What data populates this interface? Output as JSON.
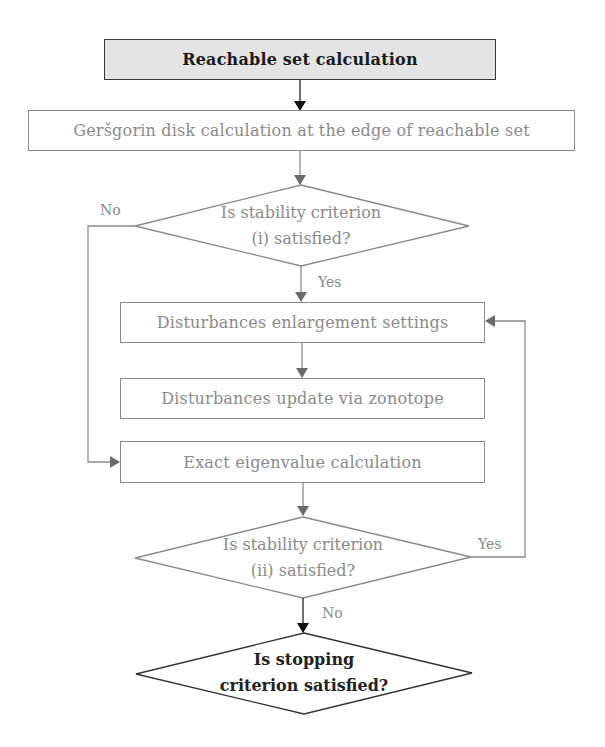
{
  "diagram": {
    "type": "flowchart",
    "nodes": {
      "start": {
        "label": "Reachable set calculation",
        "shape": "rectangle",
        "fill": "#e4e4e4"
      },
      "gersgorin": {
        "label": "Geršgorin disk calculation at the edge of reachable set",
        "shape": "rectangle"
      },
      "decision1": {
        "line1": "Is stability criterion",
        "line2": "(i) satisfied?",
        "shape": "diamond"
      },
      "enlarge": {
        "label": "Disturbances enlargement settings",
        "shape": "rectangle"
      },
      "update": {
        "label": "Disturbances update via zonotope",
        "shape": "rectangle"
      },
      "eigen": {
        "label": "Exact eigenvalue calculation",
        "shape": "rectangle"
      },
      "decision2": {
        "line1": "Is stability criterion",
        "line2": "(ii) satisfied?",
        "shape": "diamond"
      },
      "decision3": {
        "line1": "Is stopping",
        "line2": "criterion satisfied?",
        "shape": "diamond"
      }
    },
    "edge_labels": {
      "d1_no": "No",
      "d1_yes": "Yes",
      "d2_yes": "Yes",
      "d2_no": "No"
    },
    "edges": [
      {
        "from": "start",
        "to": "gersgorin"
      },
      {
        "from": "gersgorin",
        "to": "decision1"
      },
      {
        "from": "decision1",
        "to": "enlarge",
        "label": "Yes"
      },
      {
        "from": "decision1",
        "to": "eigen",
        "label": "No"
      },
      {
        "from": "enlarge",
        "to": "update"
      },
      {
        "from": "eigen",
        "to": "decision2"
      },
      {
        "from": "decision2",
        "to": "enlarge",
        "label": "Yes"
      },
      {
        "from": "decision2",
        "to": "decision3",
        "label": "No"
      }
    ],
    "colors": {
      "stroke_gray": "#8a8a8a",
      "stroke_dark": "#222222",
      "start_fill": "#e4e4e4"
    }
  }
}
